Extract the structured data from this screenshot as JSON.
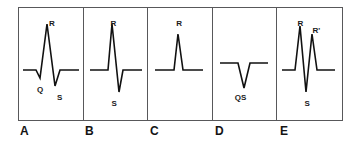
{
  "figure": {
    "frame_color": "#58585a",
    "trace_color": "#111111",
    "background_color": "#ffffff"
  },
  "panels": [
    {
      "letter": "A",
      "name": "qRs-complex",
      "pattern": "qRs",
      "labels": [
        {
          "text": "R",
          "name": "label-r",
          "x": 30,
          "y": 12
        },
        {
          "text": "Q",
          "name": "label-q",
          "x": 18,
          "y": 78
        },
        {
          "text": "S",
          "name": "label-s",
          "x": 38,
          "y": 86
        }
      ],
      "path": "M4,62 L17,62 L21,70 L28,16 L36,78 L41,62 L60,62"
    },
    {
      "letter": "B",
      "name": "rs-complex",
      "pattern": "RS",
      "labels": [
        {
          "text": "R",
          "name": "label-r",
          "x": 27,
          "y": 12
        },
        {
          "text": "S",
          "name": "label-s",
          "x": 28,
          "y": 92
        }
      ],
      "path": "M6,62 L24,62 L28,16 L35,84 L39,62 L58,62"
    },
    {
      "letter": "C",
      "name": "r-only-complex",
      "pattern": "R",
      "labels": [
        {
          "text": "R",
          "name": "label-r",
          "x": 28,
          "y": 12
        }
      ],
      "path": "M7,62 L26,62 L30,26 L35,62 L55,62"
    },
    {
      "letter": "D",
      "name": "qs-complex",
      "pattern": "QS",
      "labels": [
        {
          "text": "QS",
          "name": "label-qs",
          "x": 22,
          "y": 86
        }
      ],
      "path": "M7,55 L25,55 L31,80 L37,55 L55,55"
    },
    {
      "letter": "E",
      "name": "rsr-prime-complex",
      "pattern": "RSR'",
      "labels": [
        {
          "text": "R",
          "name": "label-r",
          "x": 20,
          "y": 12
        },
        {
          "text": "R'",
          "name": "label-r-prime",
          "x": 35,
          "y": 19
        },
        {
          "text": "S",
          "name": "label-s",
          "x": 27,
          "y": 92
        }
      ],
      "path": "M5,62 L18,62 L23,18 L29,84 L35,26 L40,62 L58,62"
    }
  ]
}
